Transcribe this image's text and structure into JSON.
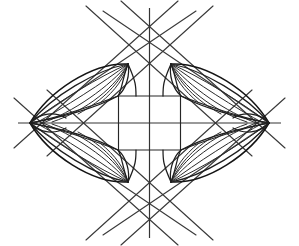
{
  "figure": {
    "background_color": "#ffffff",
    "stroke_color": "#1e1e1e",
    "width": 299,
    "height": 246,
    "center": {
      "x": 149.5,
      "y": 123.0
    },
    "vertices": {
      "left": {
        "x": 30.0,
        "y": 123.0
      },
      "right": {
        "x": 269.0,
        "y": 123.0
      },
      "top": {
        "x": 149.5,
        "y": 16.0
      },
      "bottom": {
        "x": 149.5,
        "y": 230.0
      }
    },
    "cusps": [
      {
        "name": "cusp-top-left",
        "x": 128.0,
        "y": 64.0
      },
      {
        "name": "cusp-top-right",
        "x": 171.0,
        "y": 64.0
      },
      {
        "name": "cusp-bottom-left",
        "x": 128.0,
        "y": 182.0
      },
      {
        "name": "cusp-bottom-right",
        "x": 171.0,
        "y": 182.0
      }
    ],
    "center_square": {
      "name": "central-square",
      "half_width": 31.0,
      "half_height": 27.0
    },
    "axes": {
      "horizontal_label": "horizontal-axis",
      "vertical_label": "vertical-axis",
      "horizontal_extent": [
        18,
        281
      ],
      "vertical_extent": [
        8,
        238
      ]
    },
    "petals": [
      {
        "name": "petal-upper-left",
        "curve_count": 7
      },
      {
        "name": "petal-upper-right",
        "curve_count": 7
      },
      {
        "name": "petal-lower-left",
        "curve_count": 7
      },
      {
        "name": "petal-lower-right",
        "curve_count": 7
      }
    ],
    "tangent_lines": [
      {
        "name": "tangent-line-1",
        "x1": 12,
        "y1": 150,
        "x2": 172,
        "y2": 2
      },
      {
        "name": "tangent-line-2",
        "x1": 12,
        "y1": 96,
        "x2": 172,
        "y2": 244
      },
      {
        "name": "tangent-line-3",
        "x1": 287,
        "y1": 150,
        "x2": 127,
        "y2": 2
      },
      {
        "name": "tangent-line-4",
        "x1": 287,
        "y1": 96,
        "x2": 127,
        "y2": 244
      },
      {
        "name": "tangent-line-5",
        "x1": 75,
        "y1": 10,
        "x2": 236,
        "y2": 160
      },
      {
        "name": "tangent-line-6",
        "x1": 224,
        "y1": 10,
        "x2": 63,
        "y2": 160
      },
      {
        "name": "tangent-line-7",
        "x1": 75,
        "y1": 236,
        "x2": 236,
        "y2": 86
      },
      {
        "name": "tangent-line-8",
        "x1": 224,
        "y1": 236,
        "x2": 63,
        "y2": 86
      }
    ]
  }
}
